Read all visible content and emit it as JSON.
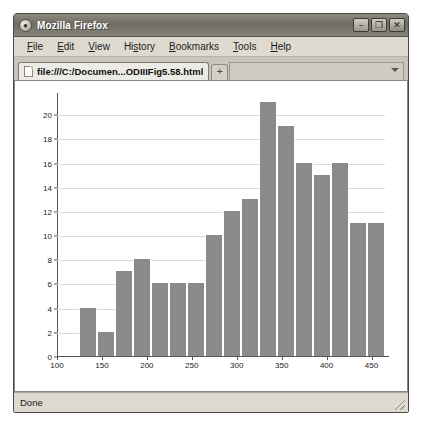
{
  "window": {
    "title": "Mozilla Firefox",
    "icon": "firefox-icon",
    "minimize_label": "–",
    "maximize_label": "❐",
    "close_label": "✕"
  },
  "menu": {
    "items": [
      {
        "label": "File",
        "mnemonic": "F"
      },
      {
        "label": "Edit",
        "mnemonic": "E"
      },
      {
        "label": "View",
        "mnemonic": "V"
      },
      {
        "label": "History",
        "mnemonic": "s"
      },
      {
        "label": "Bookmarks",
        "mnemonic": "B"
      },
      {
        "label": "Tools",
        "mnemonic": "T"
      },
      {
        "label": "Help",
        "mnemonic": "H"
      }
    ]
  },
  "tabs": {
    "active_tab_title": "file:///C:/Documen...ODIIIFig5.58.html",
    "new_tab_label": "+",
    "list_all_tabs_label": "▾"
  },
  "status": {
    "text": "Done"
  },
  "chart_data": {
    "type": "bar",
    "title": "",
    "xlabel": "",
    "ylabel": "",
    "xlim": [
      100,
      465
    ],
    "ylim": [
      0,
      21.5
    ],
    "grid": true,
    "legend": false,
    "bar_color": "#8a8a8a",
    "bin_width": 20,
    "bin_starts": [
      125,
      145,
      165,
      185,
      205,
      225,
      245,
      265,
      285,
      305,
      325,
      345,
      365,
      385,
      405,
      425
    ],
    "categories": [
      "125",
      "145",
      "165",
      "185",
      "205",
      "225",
      "245",
      "265",
      "285",
      "305",
      "325",
      "345",
      "365",
      "385",
      "405",
      "425"
    ],
    "values": [
      4,
      2,
      7,
      8,
      6,
      6,
      6,
      10,
      12,
      13,
      21,
      19,
      16,
      15,
      16,
      11
    ],
    "extra_values": [
      11
    ],
    "extra_bin_starts": [
      445
    ],
    "xticks": [
      100,
      150,
      200,
      250,
      300,
      350,
      400,
      450
    ],
    "xtick_labels": [
      "100",
      "150",
      "200",
      "250",
      "300",
      "350",
      "400",
      "450"
    ],
    "yticks": [
      0,
      2,
      4,
      6,
      8,
      10,
      12,
      14,
      16,
      18,
      20
    ],
    "ytick_labels": [
      "0",
      "2",
      "4",
      "6",
      "8",
      "10",
      "12",
      "14",
      "16",
      "18",
      "20"
    ]
  }
}
